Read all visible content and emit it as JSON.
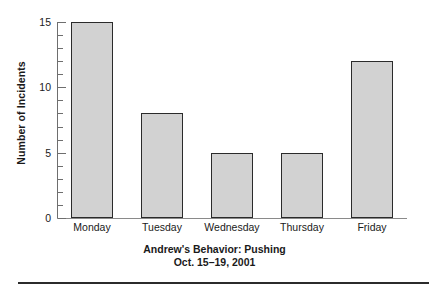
{
  "chart_data": {
    "type": "bar",
    "title": "Andrew's Behavior: Pushing",
    "subtitle": "Oct. 15–19, 2001",
    "xlabel": "",
    "ylabel": "Number of Incidents",
    "categories": [
      "Monday",
      "Tuesday",
      "Wednesday",
      "Thursday",
      "Friday"
    ],
    "values": [
      15,
      8,
      5,
      5,
      12
    ],
    "ylim": [
      0,
      15
    ],
    "y_major_ticks": [
      0,
      5,
      10,
      15
    ],
    "y_major_tick_labels": [
      "0",
      "5",
      "10",
      "15"
    ],
    "y_minor_tick_step": 1,
    "grid": false,
    "legend": false,
    "bar_fill_color": "#d2d2d2",
    "bar_edge_color": "#2b2b2b",
    "axis_color": "#6e6e6e"
  },
  "figure": {
    "bottom_rule": true
  }
}
